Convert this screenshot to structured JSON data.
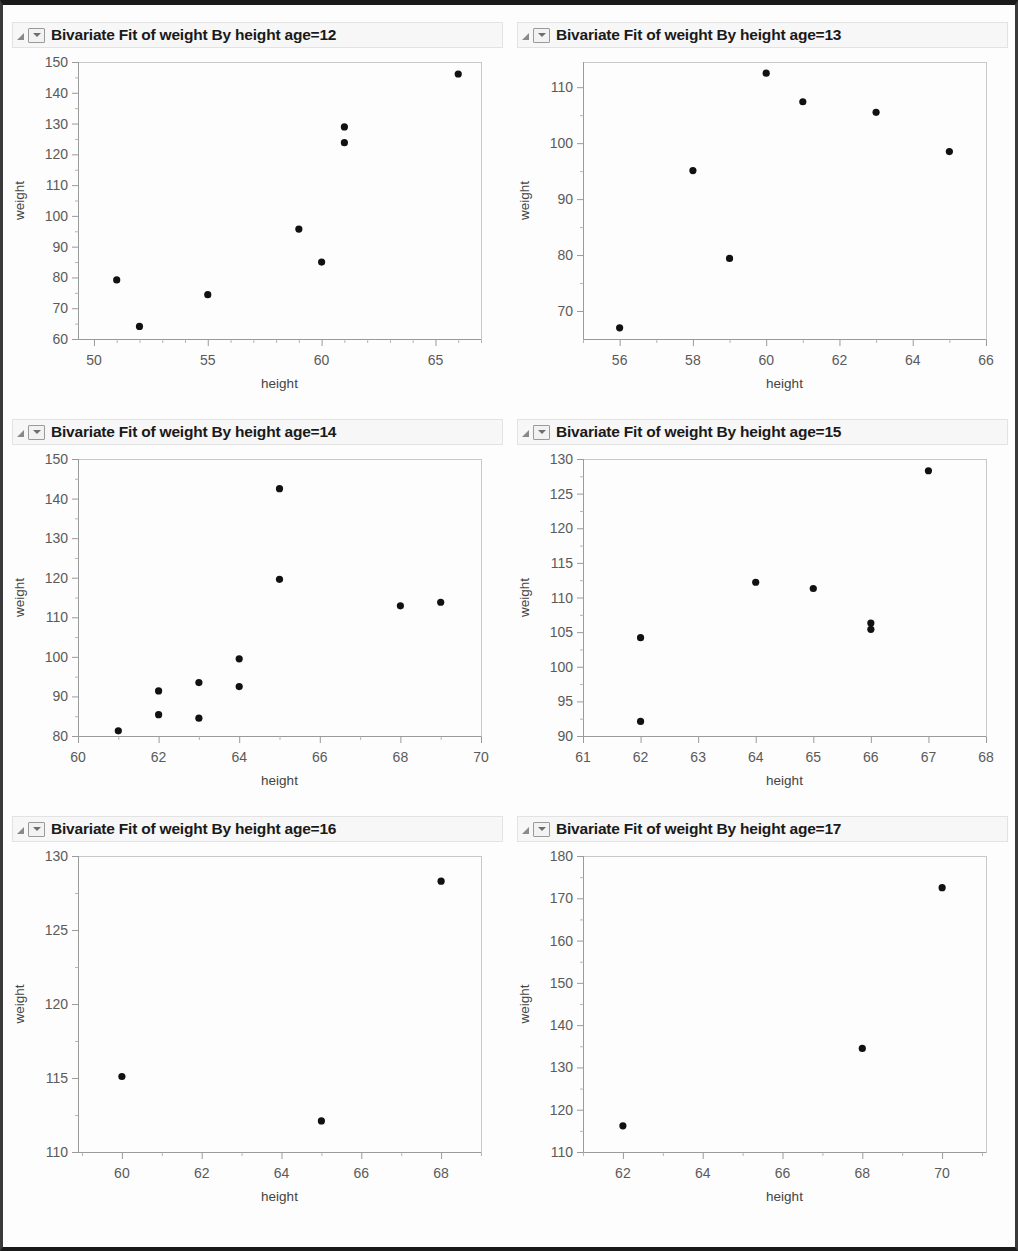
{
  "window": {
    "title_prefix": "Bivariate Fit of weight By height"
  },
  "icons": {
    "disclosure": "disclosure-triangle-icon",
    "dropdown": "chevron-down-icon"
  },
  "panels": [
    {
      "title": "Bivariate Fit of weight By height age=12"
    },
    {
      "title": "Bivariate Fit of weight By height age=13"
    },
    {
      "title": "Bivariate Fit of weight By height age=14"
    },
    {
      "title": "Bivariate Fit of weight By height age=15"
    },
    {
      "title": "Bivariate Fit of weight By height age=16"
    },
    {
      "title": "Bivariate Fit of weight By height age=17"
    }
  ],
  "chart_data": [
    {
      "type": "scatter",
      "title": "Bivariate Fit of weight By height age=12",
      "group": "age=12",
      "xlabel": "height",
      "ylabel": "weight",
      "xlim": [
        49.3,
        67.0
      ],
      "ylim": [
        60,
        150
      ],
      "xticks": [
        50,
        55,
        60,
        65
      ],
      "yticks": [
        60,
        70,
        80,
        90,
        100,
        110,
        120,
        130,
        140,
        150
      ],
      "x_minor_step": 1,
      "grid": false,
      "legend": "none",
      "points": [
        {
          "x": 51,
          "y": 79.2
        },
        {
          "x": 52,
          "y": 64.1
        },
        {
          "x": 55,
          "y": 74.4
        },
        {
          "x": 59,
          "y": 95.7
        },
        {
          "x": 60,
          "y": 85.0
        },
        {
          "x": 61,
          "y": 128.9
        },
        {
          "x": 61,
          "y": 123.8
        },
        {
          "x": 66,
          "y": 146.1
        }
      ]
    },
    {
      "type": "scatter",
      "title": "Bivariate Fit of weight By height age=13",
      "group": "age=13",
      "xlabel": "height",
      "ylabel": "weight",
      "xlim": [
        55.0,
        66.0
      ],
      "ylim": [
        65.0,
        114.5
      ],
      "xticks": [
        56,
        58,
        60,
        62,
        64,
        66
      ],
      "yticks": [
        70,
        80,
        90,
        100,
        110
      ],
      "x_minor_step": 1,
      "grid": false,
      "legend": "none",
      "points": [
        {
          "x": 56,
          "y": 67.0
        },
        {
          "x": 58,
          "y": 95.1
        },
        {
          "x": 59,
          "y": 79.4
        },
        {
          "x": 60,
          "y": 112.5
        },
        {
          "x": 61,
          "y": 107.4
        },
        {
          "x": 63,
          "y": 105.5
        },
        {
          "x": 65,
          "y": 98.5
        }
      ]
    },
    {
      "type": "scatter",
      "title": "Bivariate Fit of weight By height age=14",
      "group": "age=14",
      "xlabel": "height",
      "ylabel": "weight",
      "xlim": [
        60.0,
        70.0
      ],
      "ylim": [
        80,
        150
      ],
      "xticks": [
        60,
        62,
        64,
        66,
        68,
        70
      ],
      "yticks": [
        80,
        90,
        100,
        110,
        120,
        130,
        140,
        150
      ],
      "x_minor_step": 1,
      "grid": false,
      "legend": "none",
      "points": [
        {
          "x": 61,
          "y": 81.3
        },
        {
          "x": 62,
          "y": 91.4
        },
        {
          "x": 62,
          "y": 85.4
        },
        {
          "x": 63,
          "y": 93.5
        },
        {
          "x": 63,
          "y": 84.5
        },
        {
          "x": 64,
          "y": 99.5
        },
        {
          "x": 64,
          "y": 92.5
        },
        {
          "x": 65,
          "y": 142.5
        },
        {
          "x": 65,
          "y": 119.6
        },
        {
          "x": 68,
          "y": 112.9
        },
        {
          "x": 69,
          "y": 113.8
        }
      ]
    },
    {
      "type": "scatter",
      "title": "Bivariate Fit of weight By height age=15",
      "group": "age=15",
      "xlabel": "height",
      "ylabel": "weight",
      "xlim": [
        61.0,
        68.0
      ],
      "ylim": [
        90,
        130
      ],
      "xticks": [
        61,
        62,
        63,
        64,
        65,
        66,
        67,
        68
      ],
      "yticks": [
        90,
        95,
        100,
        105,
        110,
        115,
        120,
        125,
        130
      ],
      "x_minor_step": 1,
      "grid": false,
      "legend": "none",
      "points": [
        {
          "x": 62,
          "y": 104.2
        },
        {
          "x": 62,
          "y": 92.1
        },
        {
          "x": 64,
          "y": 112.2
        },
        {
          "x": 65,
          "y": 111.3
        },
        {
          "x": 66,
          "y": 106.3
        },
        {
          "x": 66,
          "y": 105.4
        },
        {
          "x": 67,
          "y": 128.3
        }
      ]
    },
    {
      "type": "scatter",
      "title": "Bivariate Fit of weight By height age=16",
      "group": "age=16",
      "xlabel": "height",
      "ylabel": "weight",
      "xlim": [
        58.9,
        69.0
      ],
      "ylim": [
        110,
        130
      ],
      "xticks": [
        60,
        62,
        64,
        66,
        68
      ],
      "yticks": [
        110,
        115,
        120,
        125,
        130
      ],
      "x_minor_step": 1,
      "grid": false,
      "legend": "none",
      "points": [
        {
          "x": 60,
          "y": 115.1
        },
        {
          "x": 65,
          "y": 112.1
        },
        {
          "x": 68,
          "y": 128.3
        }
      ]
    },
    {
      "type": "scatter",
      "title": "Bivariate Fit of weight By height age=17",
      "group": "age=17",
      "xlabel": "height",
      "ylabel": "weight",
      "xlim": [
        61.0,
        71.1
      ],
      "ylim": [
        110,
        180
      ],
      "xticks": [
        62,
        64,
        66,
        68,
        70
      ],
      "yticks": [
        110,
        120,
        130,
        140,
        150,
        160,
        170,
        180
      ],
      "x_minor_step": 1,
      "grid": false,
      "legend": "none",
      "points": [
        {
          "x": 62,
          "y": 116.2
        },
        {
          "x": 68,
          "y": 134.5
        },
        {
          "x": 70,
          "y": 172.5
        }
      ]
    }
  ]
}
